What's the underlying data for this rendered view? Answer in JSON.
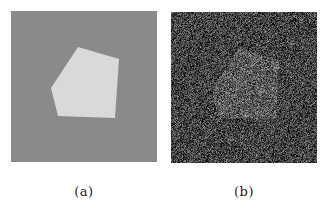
{
  "figure": {
    "panels": [
      {
        "id": "a",
        "caption": "(a)",
        "description": "clean synthetic image: light pentagon on uniform gray background",
        "background_color": "#8a8a8a",
        "shape_color": "#d9d9d9",
        "shape_points": [
          [
            67,
            36
          ],
          [
            108,
            48
          ],
          [
            104,
            107
          ],
          [
            47,
            105
          ],
          [
            40,
            77
          ]
        ]
      },
      {
        "id": "b",
        "caption": "(b)",
        "description": "same image corrupted by heavy noise",
        "background_mean": 68,
        "shape_mean": 92,
        "noise_amplitude": 70,
        "shape_points": [
          [
            67,
            36
          ],
          [
            108,
            48
          ],
          [
            104,
            107
          ],
          [
            47,
            105
          ],
          [
            40,
            77
          ]
        ]
      }
    ]
  }
}
